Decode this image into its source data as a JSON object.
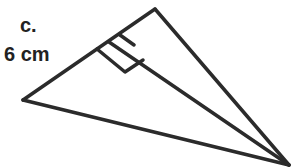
{
  "labels": {
    "part": "c.",
    "side_length": "6 cm"
  },
  "figure": {
    "type": "triangle-with-altitude",
    "vertices": {
      "top": [
        155,
        9
      ],
      "left": [
        23,
        100
      ],
      "bottom_right": [
        289,
        165
      ]
    },
    "altitude_foot": [
      109,
      42
    ],
    "right_angle_marker": true,
    "stroke_color": "#2b2b2b"
  }
}
